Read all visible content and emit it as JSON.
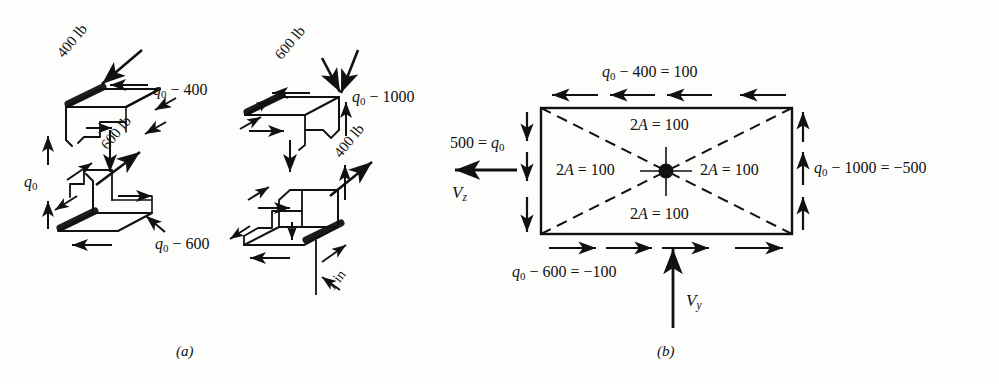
{
  "figure": {
    "type": "engineering-diagram",
    "panels": [
      {
        "id": "a",
        "caption": "(a)",
        "description": "Exploded isometric views of upper and lower cell elements showing applied shear forces and shear flows"
      },
      {
        "id": "b",
        "caption": "(b)",
        "description": "Plan view of rectangular cross-section with shear flow values on each wall and 2A = 100 for each triangular sector"
      }
    ]
  },
  "panel_a": {
    "caption": "(a)",
    "left_assembly": {
      "force_top": "400 lb",
      "force_mid": "600 lb",
      "flow_right_top": "q₀ − 400",
      "flow_left": "q₀",
      "flow_bottom": "q₀ − 600"
    },
    "right_assembly": {
      "force_top": "600 lb",
      "force_mid": "400 lb",
      "flow_right_top": "q₀ − 1000",
      "dimension": "1 in"
    },
    "labels": {
      "force_400_top": "400 lb",
      "force_600_mid": "600 lb",
      "q0_minus_400": "q₀ − 400",
      "q0": "q₀",
      "q0_minus_600": "q₀ − 600",
      "force_600_top": "600 lb",
      "force_400_mid": "400 lb",
      "q0_minus_1000": "q₀ − 1000",
      "one_inch": "1 in"
    }
  },
  "panel_b": {
    "caption": "(b)",
    "top_edge_label": "q₀ − 400 = 100",
    "bottom_edge_label": "q₀ − 600 = −100",
    "right_edge_label": "q₀ − 1000 = −500",
    "left_edge_label": "500 = q₀",
    "shear_left": "V",
    "shear_left_sub": "z",
    "shear_bottom": "V",
    "shear_bottom_sub": "y",
    "sector_labels": [
      {
        "position": "top",
        "text": "2A = 100"
      },
      {
        "position": "left",
        "text": "2A = 100"
      },
      {
        "position": "right",
        "text": "2A = 100"
      },
      {
        "position": "bottom",
        "text": "2A = 100"
      }
    ],
    "values": {
      "q0": 500,
      "top_wall_flow": 100,
      "bottom_wall_flow": -100,
      "right_wall_flow": -500,
      "twice_area_each_sector": 100
    },
    "arrow_counts": {
      "top": 4,
      "bottom": 4,
      "left": 3,
      "right": 3
    },
    "arrow_directions": {
      "top": "left",
      "bottom": "right",
      "left": "down",
      "right": "up"
    }
  },
  "colors": {
    "ink": "#111111",
    "paper": "#fdfdfb"
  }
}
